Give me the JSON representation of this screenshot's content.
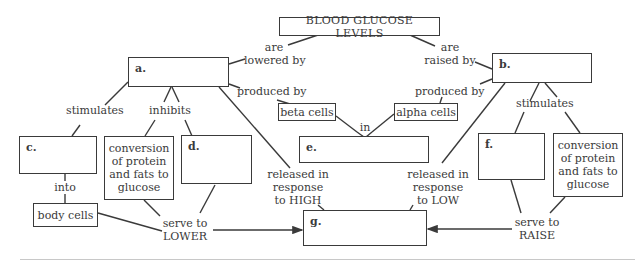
{
  "title": "BLOOD GLUCOSE LEVELS",
  "boxes": {
    "a": "a.",
    "b": "b.",
    "c": "c.",
    "d": "d.",
    "e": "e.",
    "f": "f.",
    "g": "g."
  },
  "concepts": {
    "beta_cells": "beta cells",
    "alpha_cells": "alpha cells",
    "body_cells": "body cells",
    "conversion_left": "conversion of protein and fats to glucose",
    "conversion_right": "conversion of protein and fats to glucose"
  },
  "links": {
    "are_lowered_by": [
      "are",
      "lowered by"
    ],
    "are_raised_by": [
      "are",
      "raised by"
    ],
    "produced_by_left": "produced by",
    "produced_by_right": "produced by",
    "stimulates_left": "stimulates",
    "inhibits": "inhibits",
    "stimulates_right": "stimulates",
    "in": "in",
    "into": "into",
    "released_high": [
      "released in",
      "response",
      "to HIGH"
    ],
    "released_low": [
      "released in",
      "response",
      "to LOW"
    ],
    "serve_lower": [
      "serve to",
      "LOWER"
    ],
    "serve_raise": [
      "serve to",
      "RAISE"
    ]
  }
}
